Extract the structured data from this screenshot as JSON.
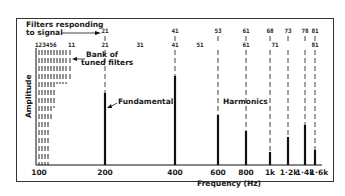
{
  "chart_data": {
    "type": "bar",
    "title": "",
    "xlabel": "Frequency (Hz)",
    "ylabel": "Amplitude",
    "x_tick_labels": [
      "100",
      "200",
      "400",
      "600",
      "800",
      "1k",
      "1·2k",
      "1·4k",
      "1·6k"
    ],
    "categories": [
      "200",
      "400",
      "600",
      "800",
      "1k",
      "1·2k",
      "1·4k",
      "1·6k"
    ],
    "values": [
      72,
      89,
      50,
      34,
      13,
      28,
      40,
      15
    ],
    "units": "relative amplitude (% of axis height)",
    "annotations": {
      "filters_responding": "Filters responding to signal",
      "bank": "Bank of tuned filters",
      "fundamental": "Fundamental",
      "harmonics": "Harmonics"
    },
    "filter_numbers_top": [
      {
        "label": "21",
        "freq": "200"
      },
      {
        "label": "41",
        "freq": "400"
      },
      {
        "label": "53",
        "freq": "600"
      },
      {
        "label": "61",
        "freq": "800"
      },
      {
        "label": "68",
        "freq": "1k"
      },
      {
        "label": "73",
        "freq": "1·2k"
      },
      {
        "label": "78",
        "freq": "1·4k"
      },
      {
        "label": "81",
        "freq": "1·6k"
      }
    ],
    "filter_numbers_row2": [
      "123456",
      "11",
      "21",
      "31",
      "41",
      "51",
      "61",
      "71",
      "81"
    ]
  },
  "labels": {
    "filters_responding_line1": "Filters responding",
    "filters_responding_line2": "to signal",
    "bank_line1": "Bank of",
    "bank_line2": "tuned filters",
    "fundamental": "Fundamental",
    "harmonics": "Harmonics",
    "ylabel": "Amplitude",
    "xlabel": "Frequency  (Hz)",
    "row2_first": "123456",
    "row2_11": "11"
  },
  "top_numbers": [
    {
      "text": "21",
      "x": 105
    },
    {
      "text": "41",
      "x": 175
    },
    {
      "text": "53",
      "x": 218
    },
    {
      "text": "61",
      "x": 246
    },
    {
      "text": "68",
      "x": 270
    },
    {
      "text": "73",
      "x": 288
    },
    {
      "text": "78",
      "x": 305
    },
    {
      "text": "81",
      "x": 315
    }
  ],
  "row2_numbers": [
    {
      "text": "21",
      "x": 105
    },
    {
      "text": "31",
      "x": 140
    },
    {
      "text": "41",
      "x": 175
    },
    {
      "text": "51",
      "x": 206
    },
    {
      "text": "61",
      "x": 246
    },
    {
      "text": "71",
      "x": 281
    },
    {
      "text": "81",
      "x": 315
    }
  ],
  "x_ticks": [
    {
      "text": "100",
      "x": 39
    },
    {
      "text": "200",
      "x": 105
    },
    {
      "text": "400",
      "x": 175
    },
    {
      "text": "600",
      "x": 218
    },
    {
      "text": "800",
      "x": 246
    },
    {
      "text": "1k",
      "x": 270
    },
    {
      "text": "1·2k",
      "x": 289
    },
    {
      "text": "1·4k",
      "x": 305
    },
    {
      "text": "1·6k",
      "x": 319
    }
  ],
  "bars": [
    {
      "freq": "200",
      "x": 105,
      "top": 93
    },
    {
      "freq": "400",
      "x": 175,
      "top": 76
    },
    {
      "freq": "600",
      "x": 218,
      "top": 115
    },
    {
      "freq": "800",
      "x": 246,
      "top": 131
    },
    {
      "freq": "1k",
      "x": 270,
      "top": 152
    },
    {
      "freq": "1·2k",
      "x": 288,
      "top": 137
    },
    {
      "freq": "1·4k",
      "x": 305,
      "top": 125
    },
    {
      "freq": "1·6k",
      "x": 315,
      "top": 150
    }
  ]
}
